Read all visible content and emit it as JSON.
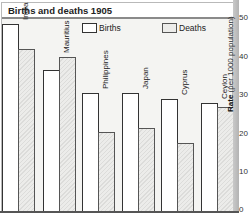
{
  "chart_data": {
    "type": "bar",
    "title": "Births and deaths 1905",
    "xlabel": "",
    "ylabel": "Rate (per 1000 population)",
    "ylabel_bold": "Rate",
    "ylabel_rest": " (per 1000 population)",
    "ylim": [
      0,
      50
    ],
    "yticks": [
      0,
      10,
      20,
      30,
      40,
      50
    ],
    "y_axis_position": "right",
    "grid": false,
    "legend_position": "top",
    "categories": [
      "India",
      "Mauritius",
      "Philippines",
      "Japan",
      "Cyprus",
      "Ceylon"
    ],
    "series": [
      {
        "name": "Births",
        "values": [
          48.5,
          36.5,
          30.5,
          30.5,
          29,
          28
        ],
        "color": "#ffffff"
      },
      {
        "name": "Deaths",
        "values": [
          42,
          40,
          20.5,
          21.5,
          17.5,
          27
        ],
        "color": "#e4e4e2"
      }
    ]
  },
  "legend": {
    "births": "Births",
    "deaths": "Deaths"
  },
  "ticks": {
    "t0": "0",
    "t10": "10",
    "t20": "20",
    "t30": "30",
    "t40": "40",
    "t50": "50"
  }
}
